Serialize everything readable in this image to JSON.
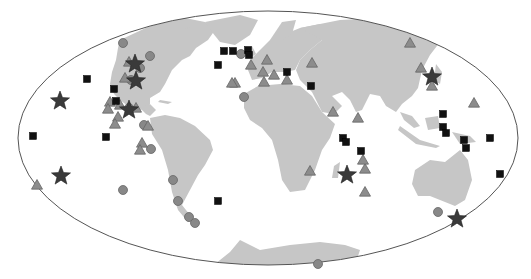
{
  "map": {
    "projection": "mollweide-like ellipse",
    "colors": {
      "land": "#c6c6c6",
      "ocean": "#ffffff",
      "outline": "#555555",
      "circle": "#888888",
      "triangle": "#8c8c8c",
      "square": "#111111",
      "star": "#3a3a3a"
    },
    "legend_visible": false
  },
  "markers": {
    "circles": [
      [
        123,
        43
      ],
      [
        150,
        56
      ],
      [
        140,
        68
      ],
      [
        131,
        80
      ],
      [
        244,
        97
      ],
      [
        129,
        108
      ],
      [
        144,
        125
      ],
      [
        151,
        149
      ],
      [
        173,
        180
      ],
      [
        178,
        201
      ],
      [
        189,
        217
      ],
      [
        195,
        223
      ],
      [
        123,
        190
      ],
      [
        241,
        54
      ],
      [
        438,
        212
      ],
      [
        318,
        264
      ]
    ],
    "triangles": [
      [
        129,
        62
      ],
      [
        125,
        78
      ],
      [
        148,
        126
      ],
      [
        110,
        102
      ],
      [
        108,
        109
      ],
      [
        120,
        105
      ],
      [
        118,
        117
      ],
      [
        115,
        124
      ],
      [
        136,
        108
      ],
      [
        142,
        143
      ],
      [
        140,
        150
      ],
      [
        251,
        65
      ],
      [
        235,
        83
      ],
      [
        264,
        82
      ],
      [
        263,
        72
      ],
      [
        267,
        60
      ],
      [
        312,
        63
      ],
      [
        333,
        112
      ],
      [
        358,
        118
      ],
      [
        410,
        43
      ],
      [
        421,
        68
      ],
      [
        432,
        86
      ],
      [
        474,
        103
      ],
      [
        310,
        171
      ],
      [
        365,
        169
      ],
      [
        363,
        160
      ],
      [
        365,
        192
      ],
      [
        37,
        185
      ],
      [
        232,
        83
      ],
      [
        274,
        75
      ],
      [
        287,
        80
      ]
    ],
    "squares": [
      [
        87,
        79
      ],
      [
        114,
        89
      ],
      [
        116,
        101
      ],
      [
        33,
        136
      ],
      [
        106,
        137
      ],
      [
        224,
        51
      ],
      [
        233,
        51
      ],
      [
        248,
        50
      ],
      [
        218,
        65
      ],
      [
        249,
        55
      ],
      [
        287,
        72
      ],
      [
        311,
        86
      ],
      [
        343,
        138
      ],
      [
        346,
        142
      ],
      [
        361,
        151
      ],
      [
        443,
        114
      ],
      [
        443,
        127
      ],
      [
        446,
        133
      ],
      [
        464,
        140
      ],
      [
        466,
        148
      ],
      [
        490,
        138
      ],
      [
        500,
        174
      ],
      [
        218,
        201
      ]
    ],
    "stars": [
      [
        60,
        101
      ],
      [
        135,
        64
      ],
      [
        136,
        81
      ],
      [
        129,
        110
      ],
      [
        61,
        176
      ],
      [
        347,
        175
      ],
      [
        457,
        219
      ],
      [
        432,
        77
      ]
    ]
  }
}
